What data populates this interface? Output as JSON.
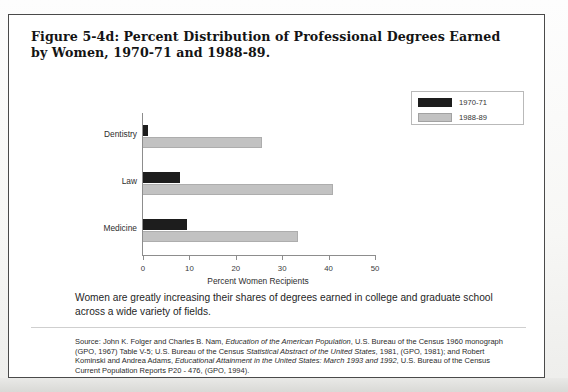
{
  "figure": {
    "title": "Figure 5-4d: Percent Distribution of Professional Degrees Earned by Women, 1970-71 and 1988-89.",
    "caption": "Women are greatly increasing their shares of degrees earned in college and graduate school across a wide variety of fields.",
    "source_prefix": "Source:",
    "source_full": "Source: John K. Folger and Charles B. Nam, Education of the American Population, U.S. Bureau of the Census 1960 monograph (GPO, 1967) Table V-5; U.S. Bureau of the Census Statistical Abstract of the United States, 1981, (GPO, 1981); and Robert Kominski and Andrea Adams, Educational Attainment in the United States: March 1993 and 1992, U.S. Bureau of the Census Current Population Reports P20 - 476, (GPO, 1994).",
    "source_segments": [
      {
        "text": "Source: John K. Folger and Charles B. Nam, ",
        "italic": false
      },
      {
        "text": "Education of the American Population",
        "italic": true
      },
      {
        "text": ", U.S. Bureau of the Census 1960 monograph (GPO, 1967) Table V-5; U.S. Bureau of the Census ",
        "italic": false
      },
      {
        "text": "Statistical Abstract of the United States",
        "italic": true
      },
      {
        "text": ", 1981, (GPO, 1981); and Robert Kominski and Andrea Adams, ",
        "italic": false
      },
      {
        "text": "Educational Attainment in the United States: March 1993 and 1992",
        "italic": true
      },
      {
        "text": ", U.S. Bureau of the Census Current Population Reports P20 - 476, (GPO, 1994).",
        "italic": false
      }
    ]
  },
  "colors": {
    "series_1970": "#1d1d1d",
    "series_1988": "#c2c2c2",
    "axis": "#8d8d8d",
    "border": "#4a4a4a",
    "text": "#1f1f1f"
  },
  "chart_data": {
    "type": "bar",
    "orientation": "horizontal",
    "title": "Percent Distribution of Professional Degrees Earned by Women, 1970-71 and 1988-89",
    "categories": [
      "Dentistry",
      "Law",
      "Medicine"
    ],
    "series": [
      {
        "name": "1970-71",
        "values": [
          1.0,
          8.0,
          9.5
        ],
        "color": "#1d1d1d"
      },
      {
        "name": "1988-89",
        "values": [
          25.6,
          41.0,
          33.4
        ],
        "color": "#c2c2c2"
      }
    ],
    "xlabel": "Percent Women Recipients",
    "ylabel": "",
    "xlim": [
      0,
      50
    ],
    "xticks": [
      0,
      10,
      20,
      30,
      40,
      50
    ],
    "xtick_labels": [
      "0",
      "10",
      "20",
      "30",
      "40",
      "50"
    ],
    "grid": false,
    "legend_position": "top-right",
    "legend_entries": [
      "1970-71",
      "1988-89"
    ]
  }
}
